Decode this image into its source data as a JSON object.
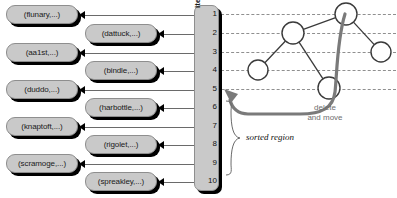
{
  "diagram": {
    "colors": {
      "box_fill": "#c9c9c9",
      "box_border": "#8e8e8e",
      "box_shadow": "#000000",
      "connector": "#6a6a6a",
      "dashed_guide": "#8f8f8f",
      "graph_edge": "#3a3a3a",
      "node_fill": "#ffffff",
      "big_arrow": "#7a7a7a",
      "annotation_gray": "#6e6e6e",
      "background": "#ffffff"
    }
  },
  "items_column": {
    "caption": "items",
    "rows": [
      {
        "number": "1",
        "y": 14
      },
      {
        "number": "2",
        "y": 33
      },
      {
        "number": "3",
        "y": 52
      },
      {
        "number": "4",
        "y": 70
      },
      {
        "number": "5",
        "y": 89
      },
      {
        "number": "6",
        "y": 107
      },
      {
        "number": "7",
        "y": 126
      },
      {
        "number": "8",
        "y": 144
      },
      {
        "number": "9",
        "y": 163
      },
      {
        "number": "10",
        "y": 181
      }
    ]
  },
  "item_boxes": [
    {
      "label": "(flunary,...)",
      "side": "left",
      "row": 1,
      "y": 5
    },
    {
      "label": "(dattuck,...)",
      "side": "right",
      "row": 2,
      "y": 24
    },
    {
      "label": "(aa1st,...)",
      "side": "left",
      "row": 3,
      "y": 43
    },
    {
      "label": "(bindle,...)",
      "side": "right",
      "row": 4,
      "y": 61
    },
    {
      "label": "(duddo,...)",
      "side": "left",
      "row": 5,
      "y": 80
    },
    {
      "label": "(harbottle,...)",
      "side": "right",
      "row": 6,
      "y": 98
    },
    {
      "label": "(knaptoft,...)",
      "side": "left",
      "row": 7,
      "y": 117
    },
    {
      "label": "(rigolet,...)",
      "side": "right",
      "row": 8,
      "y": 135
    },
    {
      "label": "(scramoge,...)",
      "side": "left",
      "row": 9,
      "y": 154
    },
    {
      "label": "(spreakley,...)",
      "side": "right",
      "row": 10,
      "y": 172
    }
  ],
  "guide_lines": [
    {
      "row": 1,
      "y": 14
    },
    {
      "row": 2,
      "y": 33
    },
    {
      "row": 3,
      "y": 52
    },
    {
      "row": 4,
      "y": 70
    },
    {
      "row": 5,
      "y": 89
    }
  ],
  "graph": {
    "nodes": [
      {
        "id": "n1",
        "cx": 346,
        "cy": 14,
        "r": 11,
        "row": 1
      },
      {
        "id": "n2",
        "cx": 293,
        "cy": 33,
        "r": 11,
        "row": 2
      },
      {
        "id": "n3",
        "cx": 381,
        "cy": 52,
        "r": 10,
        "row": 3
      },
      {
        "id": "n4",
        "cx": 258,
        "cy": 70,
        "r": 10,
        "row": 4
      },
      {
        "id": "n5",
        "cx": 329,
        "cy": 88,
        "r": 11,
        "row": 5
      }
    ],
    "edges": [
      {
        "from": "n2",
        "to": "n1"
      },
      {
        "from": "n1",
        "to": "n3"
      },
      {
        "from": "n2",
        "to": "n4"
      },
      {
        "from": "n2",
        "to": "n5"
      }
    ]
  },
  "annotations": {
    "sorted_region": "sorted region",
    "delete_line1": "delete",
    "delete_line2": "and move"
  }
}
